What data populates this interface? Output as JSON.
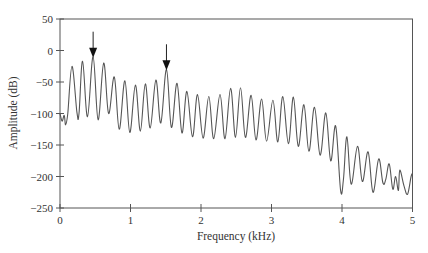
{
  "chart_data": {
    "type": "line",
    "title": "",
    "xlabel": "Frequency (kHz)",
    "ylabel": "Amplitude (dB)",
    "xlim": [
      0,
      5
    ],
    "ylim": [
      -250,
      50
    ],
    "xticks": [
      0,
      1,
      2,
      3,
      4,
      5
    ],
    "yticks": [
      50,
      0,
      -50,
      -100,
      -150,
      -200,
      -250
    ],
    "grid": false,
    "legend": null,
    "line_color": "#555555",
    "annotations": [
      {
        "type": "arrow",
        "x": 0.47,
        "y_tip": -13,
        "label": "peak-arrow-1"
      },
      {
        "type": "arrow",
        "x": 1.51,
        "y_tip": -33,
        "label": "peak-arrow-2"
      }
    ],
    "series": [
      {
        "name": "spectrum",
        "points": [
          [
            0.0,
            -100
          ],
          [
            0.03,
            -112
          ],
          [
            0.06,
            -103
          ],
          [
            0.08,
            -118
          ],
          [
            0.11,
            -100
          ],
          [
            0.17,
            -25
          ],
          [
            0.24,
            -98
          ],
          [
            0.27,
            -100
          ],
          [
            0.32,
            -17
          ],
          [
            0.39,
            -105
          ],
          [
            0.47,
            -10
          ],
          [
            0.54,
            -110
          ],
          [
            0.62,
            -20
          ],
          [
            0.69,
            -100
          ],
          [
            0.77,
            -42
          ],
          [
            0.84,
            -125
          ],
          [
            0.92,
            -48
          ],
          [
            0.99,
            -130
          ],
          [
            1.07,
            -55
          ],
          [
            1.14,
            -128
          ],
          [
            1.21,
            -53
          ],
          [
            1.28,
            -123
          ],
          [
            1.36,
            -47
          ],
          [
            1.43,
            -115
          ],
          [
            1.51,
            -30
          ],
          [
            1.58,
            -122
          ],
          [
            1.66,
            -52
          ],
          [
            1.73,
            -131
          ],
          [
            1.8,
            -65
          ],
          [
            1.88,
            -137
          ],
          [
            1.95,
            -70
          ],
          [
            2.03,
            -139
          ],
          [
            2.11,
            -73
          ],
          [
            2.18,
            -140
          ],
          [
            2.27,
            -70
          ],
          [
            2.34,
            -140
          ],
          [
            2.42,
            -60
          ],
          [
            2.49,
            -138
          ],
          [
            2.56,
            -59
          ],
          [
            2.63,
            -138
          ],
          [
            2.71,
            -71
          ],
          [
            2.78,
            -142
          ],
          [
            2.86,
            -77
          ],
          [
            2.93,
            -144
          ],
          [
            3.02,
            -79
          ],
          [
            3.09,
            -145
          ],
          [
            3.16,
            -73
          ],
          [
            3.24,
            -148
          ],
          [
            3.31,
            -74
          ],
          [
            3.38,
            -152
          ],
          [
            3.46,
            -86
          ],
          [
            3.53,
            -160
          ],
          [
            3.61,
            -90
          ],
          [
            3.69,
            -166
          ],
          [
            3.77,
            -99
          ],
          [
            3.84,
            -175
          ],
          [
            3.91,
            -120
          ],
          [
            3.98,
            -222
          ],
          [
            4.02,
            -205
          ],
          [
            4.07,
            -137
          ],
          [
            4.13,
            -212
          ],
          [
            4.22,
            -152
          ],
          [
            4.29,
            -208
          ],
          [
            4.37,
            -161
          ],
          [
            4.44,
            -225
          ],
          [
            4.52,
            -172
          ],
          [
            4.58,
            -210
          ],
          [
            4.62,
            -205
          ],
          [
            4.67,
            -180
          ],
          [
            4.72,
            -220
          ],
          [
            4.76,
            -200
          ],
          [
            4.8,
            -222
          ],
          [
            4.82,
            -190
          ],
          [
            4.88,
            -215
          ],
          [
            4.93,
            -228
          ],
          [
            4.98,
            -200
          ],
          [
            5.0,
            -195
          ]
        ]
      }
    ]
  }
}
